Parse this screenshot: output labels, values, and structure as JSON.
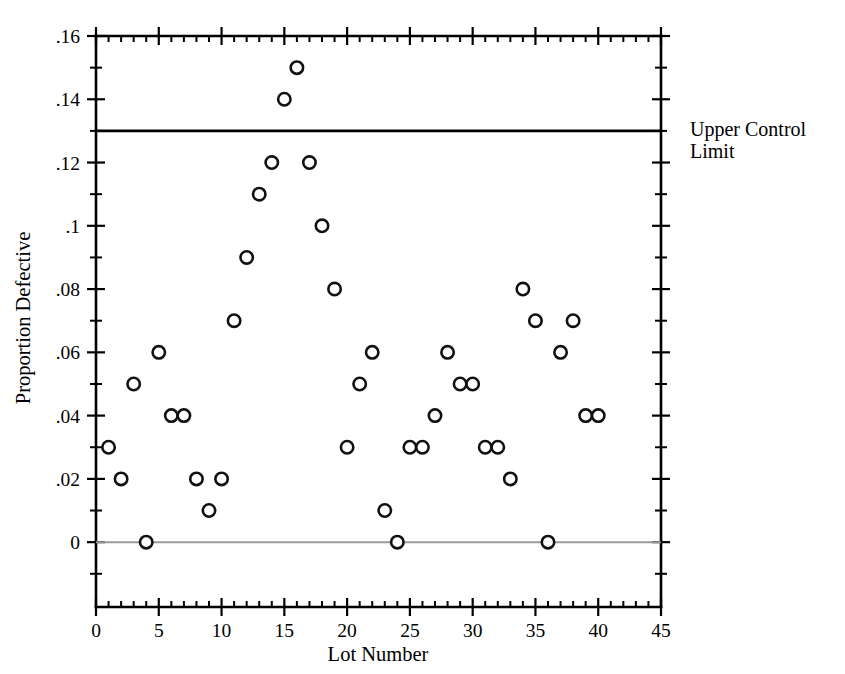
{
  "chart_data": {
    "type": "scatter",
    "title": "",
    "xlabel": "Lot Number",
    "ylabel": "Proportion Defective",
    "xlim": [
      0,
      45
    ],
    "ylim": [
      -0.0205,
      0.16
    ],
    "grid": false,
    "legend": "none",
    "x_ticks": [
      0,
      5,
      10,
      15,
      20,
      25,
      30,
      35,
      40,
      45
    ],
    "x_tick_labels": [
      "0",
      "5",
      "10",
      "15",
      "20",
      "25",
      "30",
      "35",
      "40",
      "45"
    ],
    "x_minor_step": 1,
    "y_ticks": [
      0,
      0.02,
      0.04,
      0.06,
      0.08,
      0.1,
      0.12,
      0.14,
      0.16
    ],
    "y_tick_labels": [
      "0",
      ".02",
      ".04",
      ".06",
      ".08",
      ".1",
      ".12",
      ".14",
      ".16"
    ],
    "y_minor_ticks": [
      -0.01,
      0.01,
      0.03,
      0.05,
      0.07,
      0.09,
      0.11,
      0.13,
      0.15
    ],
    "series": [
      {
        "name": "Proportion Defective",
        "marker": "open-circle",
        "x": [
          1,
          2,
          3,
          4,
          5,
          6,
          7,
          8,
          9,
          10,
          11,
          12,
          13,
          14,
          15,
          16,
          17,
          18,
          19,
          20,
          21,
          22,
          23,
          24,
          25,
          26,
          27,
          28,
          29,
          30,
          31,
          32,
          33,
          34,
          35,
          36,
          37,
          38,
          39,
          40
        ],
        "values": [
          0.03,
          0.02,
          0.05,
          0.0,
          0.06,
          0.04,
          0.04,
          0.02,
          0.01,
          0.02,
          0.07,
          0.09,
          0.11,
          0.12,
          0.14,
          0.15,
          0.12,
          0.1,
          0.08,
          0.03,
          0.05,
          0.06,
          0.01,
          0.0,
          0.03,
          0.03,
          0.04,
          0.06,
          0.05,
          0.05,
          0.03,
          0.03,
          0.02,
          0.08,
          0.07,
          0.0,
          0.06,
          0.07,
          0.04,
          0.04
        ]
      }
    ],
    "reference_lines": [
      {
        "name": "upper-control-limit",
        "value": 0.13,
        "orientation": "horizontal",
        "color": "#000000",
        "label": "Upper Control Limit"
      },
      {
        "name": "zero-baseline",
        "value": 0.0,
        "orientation": "horizontal",
        "color": "#9a9a9a",
        "label": ""
      }
    ]
  },
  "annotations": {
    "ucl_label_line1": "Upper Control",
    "ucl_label_line2": "Limit"
  }
}
